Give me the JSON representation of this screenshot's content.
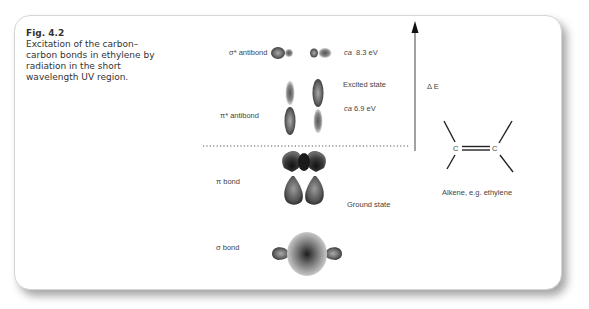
{
  "caption": {
    "figure_number": "Fig. 4.2",
    "text": "Excitation of the carbon–carbon bonds in ethylene by radiation in the short wavelength UV region."
  },
  "orbitals": {
    "sigma_star": {
      "label": "σ* antibond",
      "energy_prefix": "ca",
      "energy_value": "8.3 eV"
    },
    "pi_star": {
      "label": "π* antibond",
      "energy_prefix": "ca",
      "energy_value": "6.9 eV"
    },
    "excited_state": "Excited state",
    "pi": {
      "label": "π bond"
    },
    "ground_state": "Ground state",
    "sigma": {
      "label": "σ bond"
    }
  },
  "energy_axis": {
    "label": "Δ E"
  },
  "molecule": {
    "atom_left": "C",
    "atom_right": "C",
    "label": "Alkene, e.g. ethylene"
  },
  "colors": {
    "orbital_dark": "#2e2e2e",
    "orbital_mid": "#7a7a7a",
    "orbital_light": "#bdbdbd",
    "line": "#333333"
  }
}
